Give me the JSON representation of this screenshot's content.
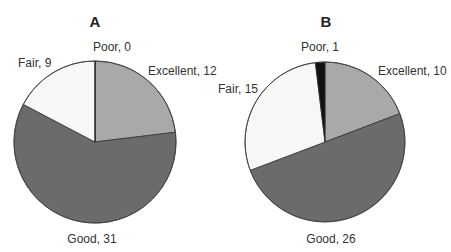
{
  "chart_data": [
    {
      "type": "pie",
      "title": "A",
      "categories": [
        "Excellent",
        "Good",
        "Fair",
        "Poor"
      ],
      "values": [
        12,
        31,
        9,
        0
      ],
      "labels": [
        "Excellent, 12",
        "Good, 31",
        "Fair, 9",
        "Poor, 0"
      ],
      "colors": [
        "#a9a9a9",
        "#6b6b6b",
        "#f7f7f5",
        "#111111"
      ],
      "start_angle": "12 o'clock, clockwise"
    },
    {
      "type": "pie",
      "title": "B",
      "categories": [
        "Excellent",
        "Good",
        "Fair",
        "Poor"
      ],
      "values": [
        10,
        26,
        15,
        1
      ],
      "labels": [
        "Excellent, 10",
        "Good, 26",
        "Fair, 15",
        "Poor, 1"
      ],
      "colors": [
        "#a9a9a9",
        "#6b6b6b",
        "#f7f7f5",
        "#111111"
      ],
      "start_angle": "12 o'clock, clockwise"
    }
  ]
}
